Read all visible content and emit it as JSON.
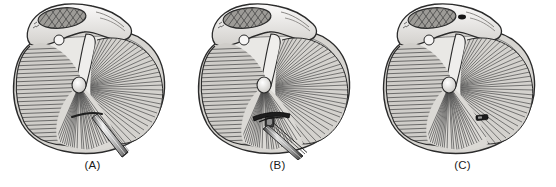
{
  "figure": {
    "background_color": "#ffffff",
    "panel_count": 3
  },
  "palette": {
    "outline": "#2b2b2b",
    "bone_light": "#f2f1ef",
    "bone_mid": "#d8d6d2",
    "bone_shadow": "#b6b3ae",
    "tissue_fiber": "#4a4a4a",
    "tissue_fill": "#cfcdc9",
    "tissue_fill_light": "#e6e5e2",
    "cut_surface_hatch": "#5c5c5c",
    "instrument_metal_light": "#e8e8e8",
    "instrument_metal_mid": "#a9a9a9",
    "instrument_metal_dark": "#3a3a3a",
    "anchor_dark": "#1e1e1e",
    "caption_color": "#1b1b1b"
  },
  "panels": [
    {
      "id": "panel-a",
      "caption": "(A)",
      "stage_description": "Straight awl / punch instrument inserted through the anterior fibers toward the glenoid rim",
      "instrument": {
        "name": "awl-instrument",
        "type": "straight-shaft-awl",
        "visible_tip": true,
        "has_anchor_head": false,
        "entry_side": "lower-right",
        "shaft_angle_deg": 42
      }
    },
    {
      "id": "panel-b",
      "caption": "(B)",
      "stage_description": "Anchor inserter advanced with T-shaped suture anchor head seated at the glenoid rim",
      "instrument": {
        "name": "anchor-inserter",
        "type": "anchor-inserter-with-head",
        "visible_tip": true,
        "has_anchor_head": true,
        "entry_side": "lower-right",
        "shaft_angle_deg": 58
      }
    },
    {
      "id": "panel-c",
      "caption": "(C)",
      "stage_description": "Instrument withdrawn; implanted anchor remains seated within the tissue",
      "instrument": {
        "name": "implanted-anchor",
        "type": "seated-anchor-only",
        "visible_tip": false,
        "has_anchor_head": true,
        "entry_side": "none",
        "shaft_angle_deg": 0
      }
    }
  ],
  "anatomy": {
    "structures": [
      {
        "name": "superior-bone-ridge",
        "label": "Superior bone ridge with cross-hatched cut surface",
        "fill": "#eceae7",
        "hatched": true
      },
      {
        "name": "cut-surface-oval",
        "label": "Cross-hatched osseous cut surface",
        "fill": "#8e8c88",
        "hatched": true
      },
      {
        "name": "left-fiber-lobe",
        "label": "Left fibrous lobe with horizontal striations",
        "fiber_direction": "horizontal",
        "fiber_count": 34
      },
      {
        "name": "right-fiber-fan",
        "label": "Right radiating fibrous fan",
        "fiber_direction": "radial",
        "fiber_count": 46
      },
      {
        "name": "inferior-fiber-fan",
        "label": "Inferior radiating fibrous fan",
        "fiber_direction": "radial",
        "fiber_count": 26
      },
      {
        "name": "central-hub-tubercle",
        "label": "Central tubercle where fibers converge",
        "fill": "#efeeec"
      },
      {
        "name": "outer-capsule-rim",
        "label": "Outer capsular rim",
        "fill": "#d5d3cf"
      }
    ]
  }
}
